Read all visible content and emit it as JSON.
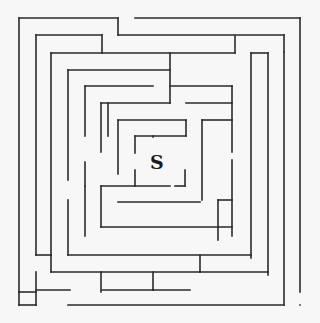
{
  "maze": {
    "start_label": "S",
    "start_pos": {
      "x": 150,
      "y": 151
    },
    "wall_color": "#2a2a2a",
    "background": "#f7f7f7",
    "walls": [
      [
        19,
        18,
        118,
        18
      ],
      [
        118,
        18,
        118,
        35
      ],
      [
        118,
        35,
        284,
        35
      ],
      [
        284,
        35,
        284,
        52
      ],
      [
        135,
        18,
        300,
        18
      ],
      [
        300,
        18,
        300,
        292
      ],
      [
        19,
        18,
        19,
        292
      ],
      [
        19,
        292,
        36,
        292
      ],
      [
        36,
        35,
        102,
        35
      ],
      [
        102,
        35,
        102,
        53
      ],
      [
        36,
        35,
        36,
        255
      ],
      [
        51,
        53,
        235,
        53
      ],
      [
        235,
        36,
        235,
        53
      ],
      [
        51,
        53,
        51,
        255
      ],
      [
        251,
        53,
        268,
        53
      ],
      [
        251,
        53,
        251,
        258
      ],
      [
        268,
        53,
        268,
        275
      ],
      [
        68,
        70,
        170,
        70
      ],
      [
        170,
        53,
        170,
        103
      ],
      [
        68,
        70,
        68,
        180
      ],
      [
        85,
        86,
        153,
        86
      ],
      [
        85,
        86,
        85,
        136
      ],
      [
        101,
        103,
        170,
        103
      ],
      [
        101,
        103,
        101,
        152
      ],
      [
        170,
        86,
        232,
        86
      ],
      [
        232,
        86,
        232,
        152
      ],
      [
        108,
        103,
        108,
        136
      ],
      [
        186,
        103,
        232,
        103
      ],
      [
        118,
        120,
        186,
        120
      ],
      [
        118,
        120,
        118,
        174
      ],
      [
        186,
        120,
        186,
        136
      ],
      [
        135,
        136,
        186,
        136
      ],
      [
        135,
        136,
        135,
        153
      ],
      [
        202,
        120,
        232,
        120
      ],
      [
        202,
        120,
        202,
        200
      ],
      [
        153,
        136,
        153,
        137
      ],
      [
        135,
        170,
        135,
        186
      ],
      [
        101,
        186,
        170,
        186
      ],
      [
        185,
        170,
        185,
        186
      ],
      [
        175,
        186,
        185,
        186
      ],
      [
        85,
        162,
        85,
        186
      ],
      [
        85,
        186,
        85,
        236
      ],
      [
        101,
        186,
        101,
        227
      ],
      [
        101,
        227,
        232,
        227
      ],
      [
        118,
        202,
        200,
        202
      ],
      [
        232,
        160,
        232,
        236
      ],
      [
        218,
        200,
        218,
        240
      ],
      [
        218,
        200,
        232,
        200
      ],
      [
        68,
        200,
        68,
        255
      ],
      [
        68,
        255,
        251,
        255
      ],
      [
        51,
        255,
        51,
        272
      ],
      [
        51,
        272,
        101,
        272
      ],
      [
        101,
        272,
        101,
        292
      ],
      [
        36,
        255,
        51,
        255
      ],
      [
        36,
        272,
        36,
        305
      ],
      [
        102,
        272,
        200,
        272
      ],
      [
        200,
        255,
        200,
        272
      ],
      [
        153,
        272,
        153,
        290
      ],
      [
        102,
        290,
        190,
        290
      ],
      [
        153,
        290,
        153,
        290
      ],
      [
        36,
        290,
        70,
        290
      ],
      [
        19,
        305,
        36,
        305
      ],
      [
        68,
        305,
        284,
        305
      ],
      [
        284,
        52,
        284,
        305
      ],
      [
        200,
        272,
        268,
        272
      ],
      [
        300,
        305,
        300,
        305
      ],
      [
        19,
        305,
        19,
        292
      ]
    ]
  }
}
